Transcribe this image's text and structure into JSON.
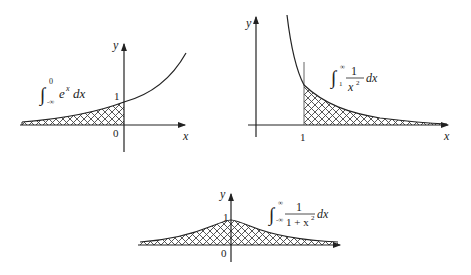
{
  "diagram": {
    "panels": [
      {
        "id": "exponential",
        "function": "e^x",
        "integral": {
          "lower": "-∞",
          "upper": "0",
          "integrand": "e",
          "exponent": "x",
          "differential": "dx"
        },
        "labels": {
          "y_axis": "y",
          "x_axis": "x",
          "origin": "0",
          "y_intercept": "1"
        }
      },
      {
        "id": "inverse-square",
        "function": "1/x^2",
        "integral": {
          "lower": "1",
          "upper": "∞",
          "numerator": "1",
          "denominator": "x",
          "exponent": "2",
          "differential": "dx"
        },
        "labels": {
          "y_axis": "y",
          "x_axis": "x",
          "x_mark": "1"
        }
      },
      {
        "id": "cauchy",
        "function": "1/(1+x^2)",
        "integral": {
          "lower": "-∞",
          "upper": "∞",
          "numerator": "1",
          "denominator": "1 + x",
          "exponent": "2",
          "differential": "dx"
        },
        "labels": {
          "y_axis": "y",
          "x_axis": "x",
          "origin": "0",
          "peak": "1"
        }
      }
    ],
    "colors": {
      "line": "#222222",
      "hatch": "#444444",
      "background": "#ffffff"
    }
  }
}
